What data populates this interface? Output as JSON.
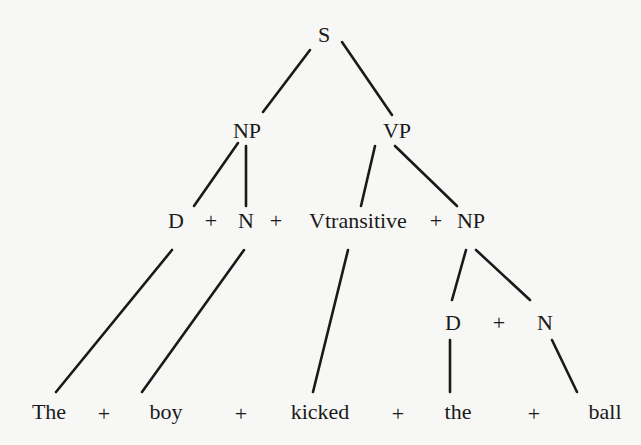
{
  "tree": {
    "root": "S",
    "level1": [
      "NP",
      "VP"
    ],
    "level2": [
      "D",
      "+",
      "N",
      "+",
      "Vtransitive",
      "+",
      "NP"
    ],
    "level3": [
      "D",
      "+",
      "N"
    ],
    "terminals": [
      "The",
      "+",
      "boy",
      "+",
      "kicked",
      "+",
      "the",
      "+",
      "ball"
    ]
  },
  "colors": {
    "ink": "#1a1a1a",
    "background": "#f7f7f5"
  }
}
